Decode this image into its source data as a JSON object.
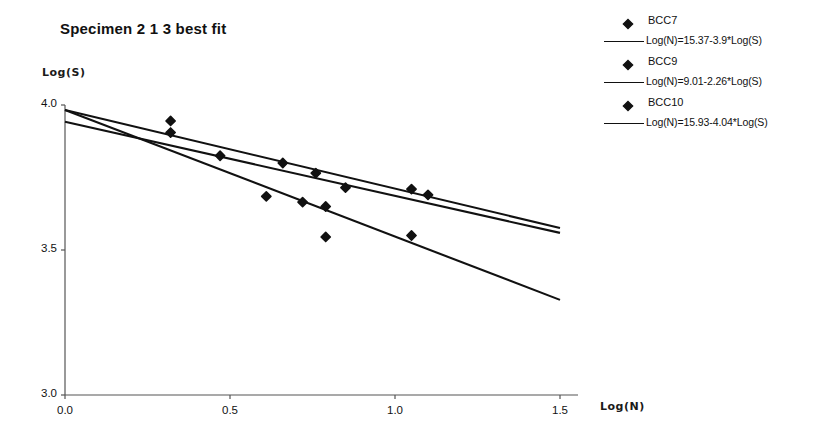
{
  "chart_data": {
    "type": "scatter",
    "title": "Specimen 2 1 3 best fit",
    "xlabel": "Log(N)",
    "ylabel": "Log(S)",
    "xlim": [
      0.0,
      1.5
    ],
    "ylim": [
      3.0,
      4.0
    ],
    "xticks": [
      "0.0",
      "0.5",
      "1.0",
      "1.5"
    ],
    "xtick_values": [
      0.0,
      0.5,
      1.0,
      1.5
    ],
    "yticks": [
      "3.0",
      "3.5",
      "4.0"
    ],
    "ytick_values": [
      3.0,
      3.5,
      4.0
    ],
    "grid": false,
    "legend_position": "right",
    "series": [
      {
        "name": "BCC7",
        "marker": "diamond",
        "color": "#111111",
        "points": [
          {
            "x": 0.32,
            "y": 3.945
          },
          {
            "x": 0.47,
            "y": 3.825
          },
          {
            "x": 0.76,
            "y": 3.765
          },
          {
            "x": 1.1,
            "y": 3.69
          }
        ]
      },
      {
        "name": "BCC9",
        "marker": "diamond",
        "color": "#111111",
        "points": [
          {
            "x": 0.32,
            "y": 3.905
          },
          {
            "x": 0.66,
            "y": 3.8
          },
          {
            "x": 0.85,
            "y": 3.715
          },
          {
            "x": 1.05,
            "y": 3.71
          }
        ]
      },
      {
        "name": "BCC10",
        "marker": "diamond",
        "color": "#111111",
        "points": [
          {
            "x": 0.61,
            "y": 3.685
          },
          {
            "x": 0.72,
            "y": 3.665
          },
          {
            "x": 0.79,
            "y": 3.65
          },
          {
            "x": 0.79,
            "y": 3.545
          },
          {
            "x": 1.05,
            "y": 3.55
          }
        ]
      }
    ],
    "fit_lines": [
      {
        "label": "Log(N)=15.37-3.9*Log(S)",
        "series": "BCC7",
        "color": "#111111",
        "endpoints": [
          {
            "x": 0.0,
            "y": 3.983
          },
          {
            "x": 1.5,
            "y": 3.576
          }
        ]
      },
      {
        "label": "Log(N)=9.01-2.26*Log(S)",
        "series": "BCC9",
        "color": "#111111",
        "endpoints": [
          {
            "x": 0.0,
            "y": 3.942
          },
          {
            "x": 1.5,
            "y": 3.559
          }
        ]
      },
      {
        "label": "Log(N)=15.93-4.04*Log(S)",
        "series": "BCC10",
        "color": "#111111",
        "endpoints": [
          {
            "x": 0.0,
            "y": 3.983
          },
          {
            "x": 1.5,
            "y": 3.328
          }
        ]
      }
    ],
    "legend_entries": [
      {
        "type": "marker",
        "label": "BCC7"
      },
      {
        "type": "line",
        "label": "Log(N)=15.37-3.9*Log(S)"
      },
      {
        "type": "marker",
        "label": "BCC9"
      },
      {
        "type": "line",
        "label": "Log(N)=9.01-2.26*Log(S)"
      },
      {
        "type": "marker",
        "label": "BCC10"
      },
      {
        "type": "line",
        "label": "Log(N)=15.93-4.04*Log(S)"
      }
    ]
  }
}
